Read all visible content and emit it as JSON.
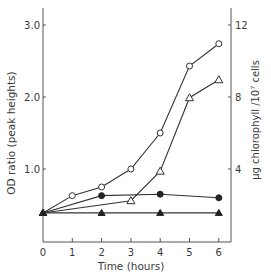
{
  "chart_data": {
    "type": "line",
    "title": "",
    "xlabel": "Time (hours)",
    "ylabel": "OD ratio (peak heights)",
    "y2label": "µg chlorophyll /10⁷ cells",
    "xlim": [
      0,
      6.4
    ],
    "ylim": [
      0,
      3.2
    ],
    "y2lim": [
      0,
      12.8
    ],
    "xticks": [
      0,
      1,
      2,
      3,
      4,
      5,
      6
    ],
    "yticks": [
      1.0,
      2.0,
      3.0
    ],
    "ytick_labels": [
      "1.0",
      "2.0",
      "3.0"
    ],
    "y2ticks": [
      4,
      8,
      12
    ],
    "y2tick_labels": [
      "4",
      "8",
      "12"
    ],
    "grid": false,
    "legend": "none",
    "series": [
      {
        "name": "open-circles",
        "marker": "open-circle",
        "x": [
          0,
          1,
          2,
          3,
          4,
          5,
          6
        ],
        "values": [
          0.39,
          0.63,
          0.75,
          1.0,
          1.5,
          2.43,
          2.74
        ]
      },
      {
        "name": "open-triangles",
        "marker": "open-triangle",
        "x": [
          0,
          3,
          4,
          5,
          6
        ],
        "values": [
          0.39,
          0.56,
          0.97,
          1.99,
          2.24
        ]
      },
      {
        "name": "filled-circles",
        "marker": "filled-circle",
        "x": [
          0,
          2,
          4,
          6
        ],
        "values": [
          0.39,
          0.63,
          0.65,
          0.6
        ]
      },
      {
        "name": "filled-triangles",
        "marker": "filled-triangle",
        "x": [
          0,
          2,
          4,
          6
        ],
        "values": [
          0.39,
          0.39,
          0.39,
          0.39
        ]
      }
    ]
  }
}
